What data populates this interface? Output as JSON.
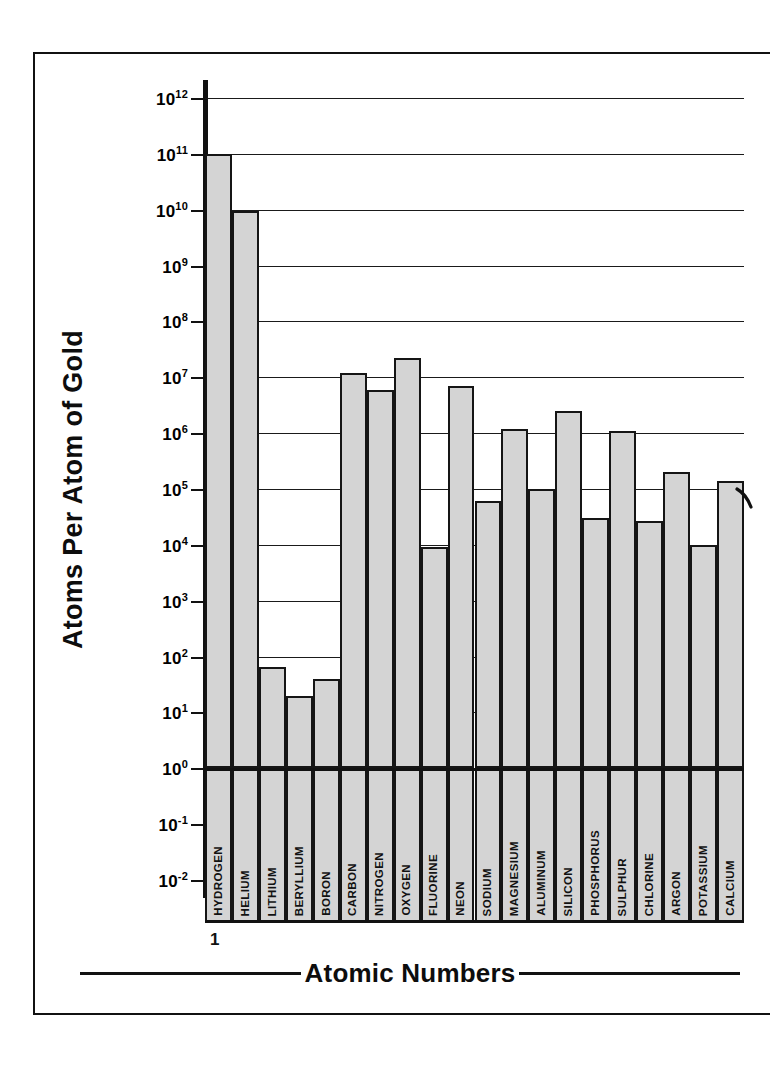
{
  "axes": {
    "y_title": "Atoms Per Atom of Gold",
    "x_title": "Atomic Numbers",
    "x_start_number": "1",
    "y_ticks": [
      "10¹²",
      "10¹¹",
      "10¹⁰",
      "10⁹",
      "10⁸",
      "10⁷",
      "10⁶",
      "10⁵",
      "10⁴",
      "10³",
      "10²",
      "10¹",
      "10⁰",
      "10⁻¹",
      "10⁻²"
    ],
    "y_tick_bases": [
      "10",
      "10",
      "10",
      "10",
      "10",
      "10",
      "10",
      "10",
      "10",
      "10",
      "10",
      "10",
      "10",
      "10",
      "10"
    ],
    "y_tick_exponents": [
      "12",
      "11",
      "10",
      "9",
      "8",
      "7",
      "6",
      "5",
      "4",
      "3",
      "2",
      "1",
      "0",
      "-1",
      "-2"
    ]
  },
  "style": {
    "bar_fill": "#d4d4d4",
    "bar_stroke": "#151515",
    "grid_color": "#1a1a1a",
    "page_background": "#ffffff"
  },
  "chart_data": {
    "type": "bar",
    "title": "",
    "xlabel": "Atomic Numbers",
    "ylabel": "Atoms Per Atom of Gold",
    "yscale": "log",
    "ylim": [
      0.01,
      1000000000000
    ],
    "grid": true,
    "legend": false,
    "categories": [
      "HYDROGEN",
      "HELIUM",
      "LITHIUM",
      "BERYLLIUM",
      "BORON",
      "CARBON",
      "NITROGEN",
      "OXYGEN",
      "FLUORINE",
      "NEON",
      "SODIUM",
      "MAGNESIUM",
      "ALUMINUM",
      "SILICON",
      "PHOSPHORUS",
      "SULPHUR",
      "CHLORINE",
      "ARGON",
      "POTASSIUM",
      "CALCIUM"
    ],
    "atomic_numbers": [
      1,
      2,
      3,
      4,
      5,
      6,
      7,
      8,
      9,
      10,
      11,
      12,
      13,
      14,
      15,
      16,
      17,
      18,
      19,
      20
    ],
    "values": [
      100000000000.0,
      9500000000.0,
      65.0,
      20.0,
      40.0,
      12000000.0,
      6000000.0,
      22000000.0,
      9000.0,
      7000000.0,
      60000.0,
      1200000.0,
      100000.0,
      2500000.0,
      30000.0,
      1100000.0,
      27000.0,
      200000.0,
      10000.0,
      140000.0
    ]
  }
}
